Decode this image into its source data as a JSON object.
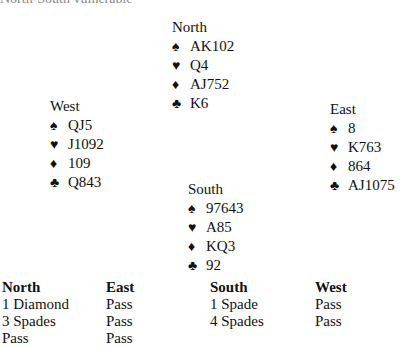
{
  "caption": "North-South vulnerable",
  "hands": {
    "north": {
      "label": "North",
      "spades": "AK102",
      "hearts": "Q4",
      "diamonds": "AJ752",
      "clubs": "K6"
    },
    "west": {
      "label": "West",
      "spades": "QJ5",
      "hearts": "J1092",
      "diamonds": "109",
      "clubs": "Q843"
    },
    "east": {
      "label": "East",
      "spades": "8",
      "hearts": "K763",
      "diamonds": "864",
      "clubs": "AJ1075"
    },
    "south": {
      "label": "South",
      "spades": "97643",
      "hearts": "A85",
      "diamonds": "KQ3",
      "clubs": "92"
    }
  },
  "suit_icons": {
    "spades": "♠",
    "hearts": "♥",
    "diamonds": "♦",
    "clubs": "♣"
  },
  "auction": {
    "columns": [
      {
        "header": "North",
        "bids": [
          "1 Diamond",
          "3 Spades",
          "Pass"
        ]
      },
      {
        "header": "East",
        "bids": [
          "Pass",
          "Pass",
          "Pass"
        ]
      },
      {
        "header": "South",
        "bids": [
          "1 Spade",
          "4 Spades"
        ]
      },
      {
        "header": "West",
        "bids": [
          "Pass",
          "Pass"
        ]
      }
    ]
  }
}
